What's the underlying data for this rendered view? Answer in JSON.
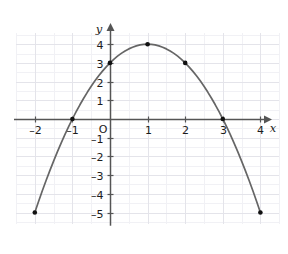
{
  "chart_data": {
    "type": "line",
    "title": "",
    "subtitle": "",
    "xlabel": "x",
    "ylabel": "y",
    "origin_label": "O",
    "xlim": [
      -2.5,
      4.5
    ],
    "ylim": [
      -5.6,
      4.6
    ],
    "xticks": [
      -2,
      -1,
      1,
      2,
      3,
      4
    ],
    "yticks": [
      4,
      3,
      2,
      1,
      -1,
      -2,
      -3,
      -4,
      -5
    ],
    "xtick_labels": [
      "–2",
      "–1",
      "1",
      "2",
      "3",
      "4"
    ],
    "ytick_labels": [
      "4",
      "3",
      "2",
      "1",
      "–1",
      "–2",
      "–3",
      "–4",
      "–5"
    ],
    "grid": true,
    "grid_major_step": 1,
    "grid_minor_step": 0.5,
    "legend": "none",
    "curve_equation": "y = -x^2 + 2x + 3",
    "series": [
      {
        "name": "parabola",
        "marked_points": [
          {
            "x": -2,
            "y": -5
          },
          {
            "x": -1,
            "y": 0
          },
          {
            "x": 0,
            "y": 3
          },
          {
            "x": 1,
            "y": 4
          },
          {
            "x": 2,
            "y": 3
          },
          {
            "x": 3,
            "y": 0
          },
          {
            "x": 4,
            "y": -5
          }
        ],
        "x": [
          -2,
          -1.9,
          -1.8,
          -1.7,
          -1.6,
          -1.5,
          -1.4,
          -1.3,
          -1.2,
          -1.1,
          -1,
          -0.9,
          -0.8,
          -0.7,
          -0.6,
          -0.5,
          -0.4,
          -0.3,
          -0.2,
          -0.1,
          0,
          0.1,
          0.2,
          0.3,
          0.4,
          0.5,
          0.6,
          0.7,
          0.8,
          0.9,
          1,
          1.1,
          1.2,
          1.3,
          1.4,
          1.5,
          1.6,
          1.7,
          1.8,
          1.9,
          2,
          2.1,
          2.2,
          2.3,
          2.4,
          2.5,
          2.6,
          2.7,
          2.8,
          2.9,
          3,
          3.1,
          3.2,
          3.3,
          3.4,
          3.5,
          3.6,
          3.7,
          3.8,
          3.9,
          4
        ],
        "y": [
          -5,
          -4.41,
          -3.84,
          -3.29,
          -2.76,
          -2.25,
          -1.76,
          -1.29,
          -0.84,
          -0.41,
          0,
          0.39,
          0.76,
          1.11,
          1.44,
          1.75,
          2.04,
          2.31,
          2.56,
          2.79,
          3,
          3.19,
          3.36,
          3.51,
          3.64,
          3.75,
          3.84,
          3.91,
          3.96,
          3.99,
          4,
          3.99,
          3.96,
          3.91,
          3.84,
          3.75,
          3.64,
          3.51,
          3.36,
          3.19,
          3,
          2.79,
          2.56,
          2.31,
          2.04,
          1.75,
          1.44,
          1.11,
          0.76,
          0.39,
          0,
          -0.41,
          -0.84,
          -1.29,
          -1.76,
          -2.25,
          -2.76,
          -3.29,
          -3.84,
          -4.41,
          -5
        ]
      }
    ]
  },
  "colors": {
    "curve": "#666666",
    "axis": "#555555",
    "grid_major": "#e3e3ea",
    "grid_minor": "#f0f0f4",
    "point": "#111111",
    "text": "#1b1b1b",
    "background": "#ffffff"
  }
}
